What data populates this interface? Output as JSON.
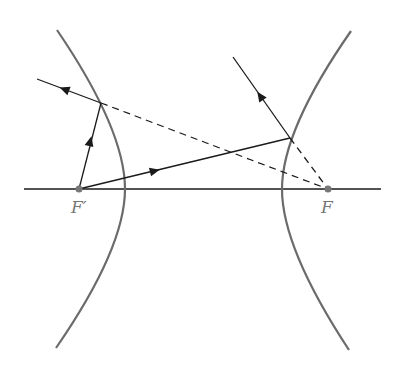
{
  "diagram": {
    "labels": {
      "left_focus": "F′",
      "right_focus": "F"
    },
    "colors": {
      "curve": "#6b6b6b",
      "ray": "#1a1a1a",
      "focus_dot": "#777777",
      "label": "#777777"
    },
    "geometry": {
      "axis": {
        "x1": 24,
        "y1": 189,
        "x2": 381,
        "y2": 189
      },
      "left_focus": {
        "x": 79,
        "y": 189
      },
      "right_focus": {
        "x": 328,
        "y": 189
      },
      "left_branch": "M57,30 Q125,130 125,189 Q125,248 56,348",
      "right_branch": "M351,31 Q282,130 282,189 Q282,248 349,350",
      "left_reflection_point": {
        "x": 101,
        "y": 103
      },
      "right_reflection_point": {
        "x": 290,
        "y": 138
      }
    }
  }
}
